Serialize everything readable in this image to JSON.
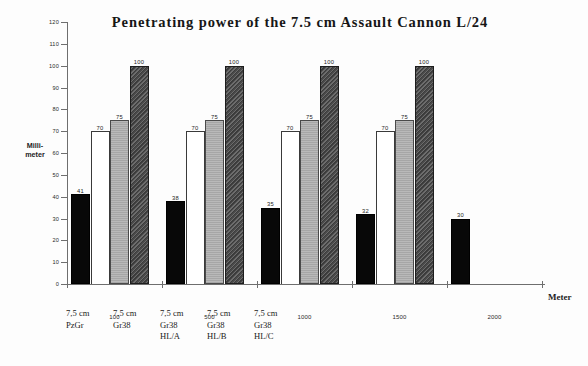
{
  "chart_data": {
    "type": "bar",
    "title": "Penetrating power of the 7.5 cm Assault Cannon L/24",
    "xlabel": "Meter",
    "ylabel": "Milli-meter",
    "ylabel_lines": [
      "Milli-",
      "meter"
    ],
    "ylim": [
      0,
      120
    ],
    "yticks": [
      0,
      10,
      20,
      30,
      40,
      50,
      60,
      70,
      80,
      90,
      100,
      110,
      120
    ],
    "xtick_labels": [
      "100",
      "500",
      "1000",
      "1500",
      "2000"
    ],
    "grid": false,
    "legend_position": "below-axis",
    "categories": [
      "100",
      "500",
      "1000",
      "1500",
      "2000"
    ],
    "series": [
      {
        "name": "7,5 cm PzGr",
        "style": "black",
        "values": [
          41,
          38,
          35,
          32,
          30
        ]
      },
      {
        "name": "7,5 cm Gr38",
        "style": "white",
        "values": [
          70,
          70,
          70,
          70,
          null
        ]
      },
      {
        "name": "7,5 cm Gr38 HL/A",
        "style": "gray",
        "values": [
          75,
          75,
          75,
          75,
          null
        ]
      },
      {
        "name": "7,5 cm Gr38 HL/B",
        "style": "dark",
        "values": [
          100,
          100,
          100,
          100,
          null
        ]
      },
      {
        "name": "7,5 cm Gr38 HL/C",
        "style": "dark",
        "values": [
          null,
          null,
          null,
          null,
          null
        ]
      }
    ],
    "colors": {
      "black": "#080808",
      "white": "#ffffff",
      "gray": "#b0b0b0",
      "dark": "#545454",
      "axis": "#6e6e6e",
      "text": "#1a1a1a"
    }
  },
  "legend": {
    "items": [
      {
        "lines": [
          "7,5 cm",
          "PzGr",
          ""
        ]
      },
      {
        "lines": [
          "7,5 cm",
          "Gr38",
          ""
        ]
      },
      {
        "lines": [
          "7,5 cm",
          "Gr38",
          "HL/A"
        ]
      },
      {
        "lines": [
          "7,5 cm",
          "Gr38",
          "HL/B"
        ]
      },
      {
        "lines": [
          "7,5 cm",
          "Gr38",
          "HL/C"
        ]
      }
    ]
  }
}
